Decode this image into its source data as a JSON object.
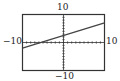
{
  "chart_data": {
    "type": "line",
    "title": "",
    "xlabel": "",
    "ylabel": "",
    "xlim": [
      -10,
      10
    ],
    "ylim": [
      -10,
      10
    ],
    "grid": false,
    "axis_ticks": "every 1 unit (dotted ticks along axes)",
    "tick_labels": {
      "top": "10",
      "bottom": "-10",
      "left": "-10",
      "right": "10"
    },
    "series": [
      {
        "name": "line",
        "x": [
          -10,
          10
        ],
        "y": [
          -2,
          7
        ]
      }
    ],
    "colors": {
      "frame": "#333333",
      "line": "#444444",
      "axes": "#333333"
    }
  },
  "labels": {
    "ymax": "10",
    "ymin": "−10",
    "xmin": "−10",
    "xmax": "10"
  }
}
